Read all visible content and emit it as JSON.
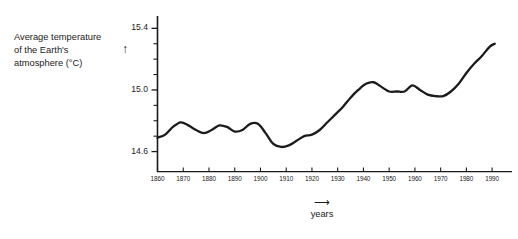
{
  "chart_data": {
    "type": "line",
    "title": "",
    "ylabel_lines": [
      "Average temperature",
      "of the Earth's",
      "atmosphere (°C)"
    ],
    "ylabel_arrow": "↑",
    "xlabel": "years",
    "xlabel_arrow": "⟶",
    "grid": false,
    "legend": "none",
    "xlim": [
      1860,
      1995
    ],
    "ylim": [
      14.47,
      15.48
    ],
    "yticks_major": [
      14.6,
      15.0,
      15.4
    ],
    "yticks_major_labels": [
      "14.6",
      "15.0",
      "15.4"
    ],
    "yticks_minor": [
      14.7,
      14.8,
      14.9,
      15.1,
      15.2,
      15.3
    ],
    "xticks": [
      1860,
      1870,
      1880,
      1890,
      1900,
      1910,
      1920,
      1930,
      1940,
      1950,
      1960,
      1970,
      1980,
      1990
    ],
    "xtick_labels": [
      "1860",
      "1870",
      "1880",
      "1890",
      "1900",
      "1910",
      "1920",
      "1930",
      "1940",
      "1950",
      "1960",
      "1970",
      "1980",
      "1990"
    ],
    "series": [
      {
        "name": "Average temperature of the Earth's atmosphere",
        "color": "#1b1b1b",
        "x": [
          1860,
          1863,
          1866,
          1869,
          1872,
          1875,
          1878,
          1881,
          1884,
          1887,
          1890,
          1893,
          1896,
          1899,
          1902,
          1905,
          1908,
          1911,
          1914,
          1917,
          1920,
          1923,
          1926,
          1929,
          1932,
          1935,
          1938,
          1941,
          1944,
          1947,
          1950,
          1953,
          1956,
          1959,
          1962,
          1965,
          1968,
          1971,
          1974,
          1977,
          1980,
          1983,
          1986,
          1989,
          1991
        ],
        "y": [
          14.69,
          14.71,
          14.76,
          14.79,
          14.77,
          14.74,
          14.72,
          14.74,
          14.77,
          14.76,
          14.73,
          14.74,
          14.78,
          14.78,
          14.72,
          14.65,
          14.63,
          14.64,
          14.67,
          14.7,
          14.71,
          14.74,
          14.79,
          14.84,
          14.89,
          14.95,
          15.0,
          15.04,
          15.05,
          15.02,
          14.99,
          14.99,
          14.99,
          15.03,
          15.0,
          14.97,
          14.96,
          14.96,
          14.99,
          15.04,
          15.11,
          15.17,
          15.22,
          15.28,
          15.3
        ]
      }
    ]
  }
}
